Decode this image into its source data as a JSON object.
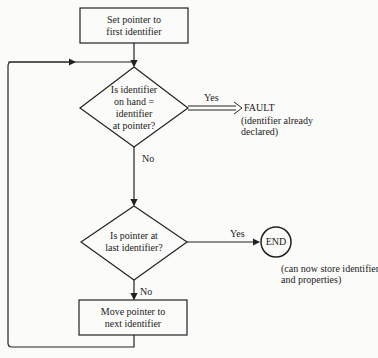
{
  "start_box": {
    "line1": "Set pointer to",
    "line2": "first identifier"
  },
  "decision1": {
    "line1": "Is identifier",
    "line2": "on hand =",
    "line3": "identifier",
    "line4": "at pointer?",
    "yes_label": "Yes",
    "no_label": "No"
  },
  "fault": {
    "title": "FAULT",
    "note1": "(identifier already",
    "note2": "declared)"
  },
  "decision2": {
    "line1": "Is pointer at",
    "line2": "last identifier?",
    "yes_label": "Yes",
    "no_label": "No"
  },
  "end": {
    "label": "END",
    "note1": "(can now store identifier",
    "note2": "and properties)"
  },
  "move_box": {
    "line1": "Move pointer to",
    "line2": "next identifier"
  }
}
